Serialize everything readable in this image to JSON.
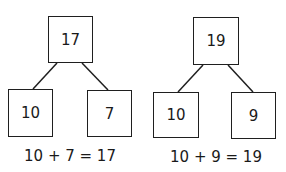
{
  "trees": [
    {
      "whole": "17",
      "parts": [
        "10",
        "7"
      ],
      "equation": "10 + 7 = 17"
    },
    {
      "whole": "19",
      "parts": [
        "10",
        "9"
      ],
      "equation": "10 + 9 = 19"
    }
  ]
}
